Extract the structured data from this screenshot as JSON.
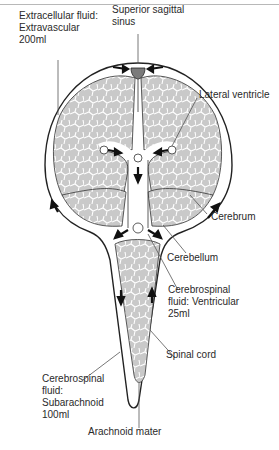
{
  "figure": {
    "colors": {
      "tissue": "#c9c9c9",
      "tissue_lines": "#ffffff",
      "outline": "#222222",
      "sinus": "#7a7a7a",
      "leader": "#555555"
    }
  },
  "labels": {
    "extracellular": "Extracellular fluid:\nExtravascular\n200ml",
    "sinus": "Superior sagittal\nsinus",
    "lateral_ventricle": "Lateral ventricle",
    "cerebrum": "Cerebrum",
    "cerebellum": "Cerebellum",
    "csf_ventricular": "Cerebrospinal\nfluid: Ventricular\n25ml",
    "spinal_cord": "Spinal cord",
    "csf_subarachnoid": "Cerebrospinal\nfluid:\nSubarachnoid\n100ml",
    "arachnoid": "Arachnoid mater"
  }
}
